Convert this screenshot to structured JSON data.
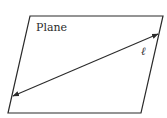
{
  "diagram": {
    "plane_label": "Plane",
    "line_label": "ℓ",
    "colors": {
      "stroke": "#2b2b2b",
      "background": "#ffffff"
    },
    "plane_vertices": [
      [
        30,
        16
      ],
      [
        163,
        16
      ],
      [
        141,
        113
      ],
      [
        8,
        113
      ]
    ],
    "line_endpoints": [
      [
        13,
        96
      ],
      [
        158,
        34
      ]
    ],
    "line_arrowheads": "both"
  }
}
